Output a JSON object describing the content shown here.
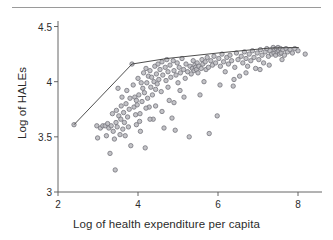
{
  "figure": {
    "top_rule": "horizontal-rule",
    "background_color": "#ffffff"
  },
  "chart_data": {
    "type": "scatter",
    "title": "",
    "xlabel": "Log of health expenditure per capita",
    "ylabel": "Log of HALEs",
    "xlim": [
      2.0,
      8.6
    ],
    "ylim": [
      3.0,
      4.55
    ],
    "xticks": [
      2,
      4,
      6,
      8
    ],
    "xtick_labels": [
      "2",
      "4",
      "6",
      "8"
    ],
    "yticks": [
      3,
      3.5,
      4,
      4.5
    ],
    "ytick_labels": [
      "3",
      "3.5",
      "4",
      "4.5"
    ],
    "grid": false,
    "legend": false,
    "marker": {
      "shape": "circle",
      "fill_color": "#b9b9bd",
      "edge_color": "#75757c",
      "size_px": 4.4,
      "opacity": 0.85
    },
    "series": [
      {
        "name": "Countries",
        "type": "scatter",
        "points": [
          [
            2.4,
            3.61
          ],
          [
            2.97,
            3.6
          ],
          [
            2.99,
            3.49
          ],
          [
            3.06,
            3.58
          ],
          [
            3.12,
            3.6
          ],
          [
            3.18,
            3.6
          ],
          [
            3.21,
            3.51
          ],
          [
            3.24,
            3.62
          ],
          [
            3.27,
            3.58
          ],
          [
            3.3,
            3.35
          ],
          [
            3.33,
            3.6
          ],
          [
            3.36,
            3.71
          ],
          [
            3.38,
            3.55
          ],
          [
            3.41,
            3.48
          ],
          [
            3.43,
            3.2
          ],
          [
            3.45,
            3.63
          ],
          [
            3.46,
            3.74
          ],
          [
            3.48,
            3.59
          ],
          [
            3.5,
            3.94
          ],
          [
            3.52,
            3.69
          ],
          [
            3.55,
            3.52
          ],
          [
            3.57,
            3.66
          ],
          [
            3.58,
            3.78
          ],
          [
            3.6,
            3.86
          ],
          [
            3.62,
            3.57
          ],
          [
            3.64,
            3.72
          ],
          [
            3.66,
            3.63
          ],
          [
            3.68,
            3.51
          ],
          [
            3.7,
            3.8
          ],
          [
            3.72,
            3.92
          ],
          [
            3.74,
            3.68
          ],
          [
            3.76,
            3.59
          ],
          [
            3.78,
            3.75
          ],
          [
            3.8,
            3.85
          ],
          [
            3.82,
            3.42
          ],
          [
            3.85,
            4.16
          ],
          [
            3.88,
            3.97
          ],
          [
            3.9,
            3.77
          ],
          [
            3.92,
            3.86
          ],
          [
            3.94,
            3.7
          ],
          [
            3.96,
            3.61
          ],
          [
            3.98,
            3.79
          ],
          [
            4.0,
            4.03
          ],
          [
            4.02,
            3.88
          ],
          [
            4.04,
            3.64
          ],
          [
            4.06,
            3.55
          ],
          [
            4.08,
            3.99
          ],
          [
            4.1,
            3.82
          ],
          [
            4.12,
            3.94
          ],
          [
            4.14,
            4.08
          ],
          [
            4.16,
            3.9
          ],
          [
            4.18,
            3.4
          ],
          [
            4.2,
            4.12
          ],
          [
            4.22,
            3.99
          ],
          [
            4.24,
            3.85
          ],
          [
            4.26,
            4.05
          ],
          [
            4.28,
            3.77
          ],
          [
            4.3,
            4.1
          ],
          [
            4.32,
            3.95
          ],
          [
            4.34,
            4.04
          ],
          [
            4.36,
            3.88
          ],
          [
            4.38,
            3.66
          ],
          [
            4.4,
            4.0
          ],
          [
            4.42,
            4.14
          ],
          [
            4.44,
            3.93
          ],
          [
            4.46,
            4.07
          ],
          [
            4.48,
            3.98
          ],
          [
            4.5,
            4.16
          ],
          [
            4.52,
            4.02
          ],
          [
            4.55,
            4.11
          ],
          [
            4.58,
            3.91
          ],
          [
            4.6,
            4.18
          ],
          [
            4.62,
            4.06
          ],
          [
            4.65,
            3.58
          ],
          [
            4.68,
            4.13
          ],
          [
            4.7,
            4.01
          ],
          [
            4.72,
            4.2
          ],
          [
            4.75,
            4.09
          ],
          [
            4.78,
            3.83
          ],
          [
            4.8,
            4.15
          ],
          [
            4.82,
            4.04
          ],
          [
            4.85,
            3.67
          ],
          [
            4.88,
            4.19
          ],
          [
            4.9,
            4.1
          ],
          [
            4.93,
            3.56
          ],
          [
            4.95,
            4.06
          ],
          [
            4.98,
            4.17
          ],
          [
            5.0,
            3.99
          ],
          [
            5.03,
            4.13
          ],
          [
            5.06,
            4.08
          ],
          [
            5.1,
            4.21
          ],
          [
            5.14,
            4.11
          ],
          [
            5.18,
            4.03
          ],
          [
            5.2,
            4.16
          ],
          [
            5.24,
            4.09
          ],
          [
            5.28,
            3.5
          ],
          [
            5.3,
            4.14
          ],
          [
            5.33,
            4.07
          ],
          [
            5.36,
            4.12
          ],
          [
            5.38,
            4.19
          ],
          [
            5.4,
            4.1
          ],
          [
            5.42,
            4.15
          ],
          [
            5.44,
            4.13
          ],
          [
            5.46,
            4.11
          ],
          [
            5.48,
            4.17
          ],
          [
            5.5,
            4.08
          ],
          [
            5.52,
            4.14
          ],
          [
            5.55,
            3.88
          ],
          [
            5.58,
            4.12
          ],
          [
            5.6,
            4.2
          ],
          [
            5.62,
            4.16
          ],
          [
            5.65,
            4.0
          ],
          [
            5.68,
            4.18
          ],
          [
            5.7,
            4.11
          ],
          [
            5.73,
            4.22
          ],
          [
            5.76,
            4.13
          ],
          [
            5.78,
            3.53
          ],
          [
            5.82,
            4.19
          ],
          [
            5.86,
            4.15
          ],
          [
            5.9,
            4.23
          ],
          [
            5.94,
            4.17
          ],
          [
            5.98,
            3.69
          ],
          [
            6.02,
            4.21
          ],
          [
            6.06,
            4.14
          ],
          [
            6.1,
            4.25
          ],
          [
            6.14,
            4.18
          ],
          [
            6.18,
            4.09
          ],
          [
            6.22,
            4.22
          ],
          [
            6.26,
            4.16
          ],
          [
            6.3,
            4.24
          ],
          [
            6.34,
            4.19
          ],
          [
            6.38,
            3.96
          ],
          [
            6.42,
            4.13
          ],
          [
            6.46,
            4.26
          ],
          [
            6.5,
            4.2
          ],
          [
            6.54,
            4.05
          ],
          [
            6.58,
            4.23
          ],
          [
            6.62,
            4.17
          ],
          [
            6.66,
            4.27
          ],
          [
            6.7,
            4.21
          ],
          [
            6.74,
            4.14
          ],
          [
            6.78,
            4.25
          ],
          [
            6.82,
            4.19
          ],
          [
            6.86,
            4.28
          ],
          [
            6.9,
            4.22
          ],
          [
            6.94,
            4.12
          ],
          [
            6.98,
            4.26
          ],
          [
            7.02,
            4.2
          ],
          [
            7.06,
            4.29
          ],
          [
            7.1,
            4.24
          ],
          [
            7.14,
            4.17
          ],
          [
            7.18,
            4.27
          ],
          [
            7.22,
            4.3
          ],
          [
            7.26,
            4.23
          ],
          [
            7.3,
            4.28
          ],
          [
            7.34,
            4.25
          ],
          [
            7.38,
            4.31
          ],
          [
            7.4,
            4.26
          ],
          [
            7.42,
            4.29
          ],
          [
            7.44,
            4.24
          ],
          [
            7.46,
            4.3
          ],
          [
            7.48,
            4.27
          ],
          [
            7.5,
            4.31
          ],
          [
            7.52,
            4.28
          ],
          [
            7.54,
            4.25
          ],
          [
            7.56,
            4.3
          ],
          [
            7.58,
            4.26
          ],
          [
            7.62,
            4.29
          ],
          [
            7.66,
            4.24
          ],
          [
            7.7,
            4.3
          ],
          [
            7.74,
            4.27
          ],
          [
            7.8,
            4.29
          ],
          [
            7.86,
            4.26
          ],
          [
            7.92,
            4.3
          ],
          [
            8.0,
            4.28
          ],
          [
            8.18,
            4.25
          ],
          [
            6.4,
            4.02
          ],
          [
            6.05,
            3.97
          ],
          [
            5.15,
            3.86
          ],
          [
            4.44,
            3.78
          ],
          [
            4.05,
            3.71
          ],
          [
            4.2,
            3.76
          ],
          [
            3.96,
            3.83
          ],
          [
            4.3,
            3.66
          ],
          [
            4.6,
            3.73
          ],
          [
            4.9,
            3.81
          ],
          [
            5.05,
            3.92
          ],
          [
            4.75,
            3.95
          ],
          [
            6.7,
            4.08
          ],
          [
            7.05,
            4.11
          ],
          [
            7.28,
            4.15
          ],
          [
            7.6,
            4.2
          ]
        ]
      },
      {
        "name": "Production frontier",
        "type": "line",
        "color": "#3a3a3a",
        "width_px": 0.9,
        "points": [
          [
            2.4,
            3.61
          ],
          [
            3.85,
            4.16
          ],
          [
            4.72,
            4.21
          ],
          [
            6.0,
            4.26
          ],
          [
            7.3,
            4.305
          ],
          [
            8.02,
            4.31
          ]
        ]
      }
    ]
  }
}
